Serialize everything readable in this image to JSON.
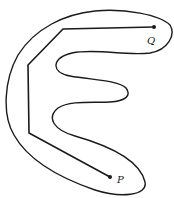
{
  "figure": {
    "points": {
      "P": {
        "label": "P",
        "x": 110,
        "y": 177
      },
      "Q": {
        "label": "Q",
        "x": 154,
        "y": 27
      }
    },
    "path_vertices": [
      [
        154,
        27
      ],
      [
        63,
        29
      ],
      [
        28,
        65
      ],
      [
        29,
        133
      ],
      [
        110,
        177
      ]
    ],
    "colors": {
      "stroke": "#1a1a1a",
      "background": "#ffffff"
    }
  }
}
